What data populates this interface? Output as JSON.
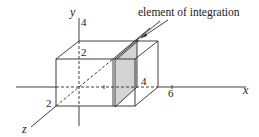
{
  "figure": {
    "axes": {
      "x": {
        "label": "x",
        "tick_label": "6"
      },
      "y": {
        "label": "y",
        "tick_labels": [
          "4",
          "2"
        ]
      },
      "z": {
        "label": "z",
        "tick_label": "2"
      }
    },
    "box_dimension_label": "4",
    "callout": {
      "text": "element of integration"
    },
    "colors": {
      "stroke": "#2a2a2a",
      "slab_shade": "#d4d4d4",
      "background": "#ffffff"
    }
  }
}
